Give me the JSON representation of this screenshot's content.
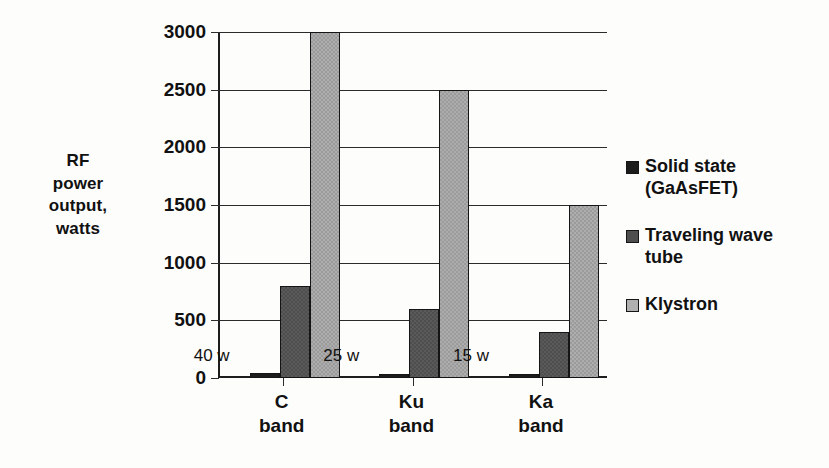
{
  "chart_data": {
    "type": "bar",
    "title": "",
    "subtitle": "",
    "xlabel": "",
    "ylabel": "RF power output, watts",
    "ylabel_lines": [
      "RF",
      "power",
      "output,",
      "watts"
    ],
    "categories": [
      "C band",
      "Ku band",
      "Ka band"
    ],
    "category_lines": [
      [
        "C",
        "band"
      ],
      [
        "Ku",
        "band"
      ],
      [
        "Ka",
        "band"
      ]
    ],
    "series": [
      {
        "name": "Solid state (GaAsFET)",
        "name_lines": [
          "Solid state",
          "(GaAsFET)"
        ],
        "color": "#1c1c1c",
        "values": [
          40,
          25,
          15
        ]
      },
      {
        "name": "Traveling wave tube",
        "name_lines": [
          "Traveling wave",
          "tube"
        ],
        "color": "#4e4e4e",
        "values": [
          800,
          600,
          400
        ]
      },
      {
        "name": "Klystron",
        "name_lines": [
          "Klystron"
        ],
        "color": "#9b9b9b",
        "values": [
          3000,
          2500,
          1500
        ]
      }
    ],
    "annotations": [
      {
        "text": "40 w",
        "category": "C band",
        "series": "Solid state (GaAsFET)"
      },
      {
        "text": "25 w",
        "category": "Ku band",
        "series": "Solid state (GaAsFET)"
      },
      {
        "text": "15 w",
        "category": "Ka band",
        "series": "Solid state (GaAsFET)"
      }
    ],
    "ylim": [
      0,
      3000
    ],
    "yticks": [
      0,
      500,
      1000,
      1500,
      2000,
      2500,
      3000
    ],
    "ytick_labels": [
      "0",
      "500",
      "1000",
      "1500",
      "2000",
      "2500",
      "3000"
    ],
    "grid": true,
    "grid_axis": "y",
    "legend_position": "right"
  }
}
